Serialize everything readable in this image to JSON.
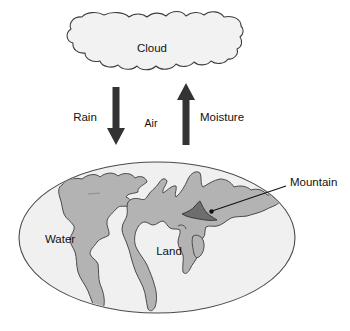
{
  "diagram": {
    "type": "water cycle / hydrologic cycle schematic",
    "colors": {
      "background": "#ffffff",
      "cloud_fill": "#f2f2f2",
      "cloud_stroke": "#3d3d3d",
      "ocean_fill": "#f0f0f0",
      "ocean_stroke": "#4a4a4a",
      "land_fill": "#b3b3b3",
      "land_stroke": "#4a4a4a",
      "mountain_fill": "#6e6e6e",
      "mountain_stroke": "#3a3a3a",
      "arrow_fill": "#333333",
      "leader_line": "#111111",
      "text": "#111111"
    },
    "cloud": {
      "label": "Cloud"
    },
    "arrows": [
      {
        "name": "rain-arrow",
        "label": "Rain",
        "direction": "down",
        "from": "Cloud",
        "to": "Earth"
      },
      {
        "name": "moisture-arrow",
        "label": "Moisture",
        "direction": "up",
        "from": "Earth",
        "to": "Cloud"
      }
    ],
    "middle_label": "Air",
    "earth": {
      "water_label": "Water",
      "land_label": "Land",
      "mountain_label": "Mountain"
    }
  }
}
